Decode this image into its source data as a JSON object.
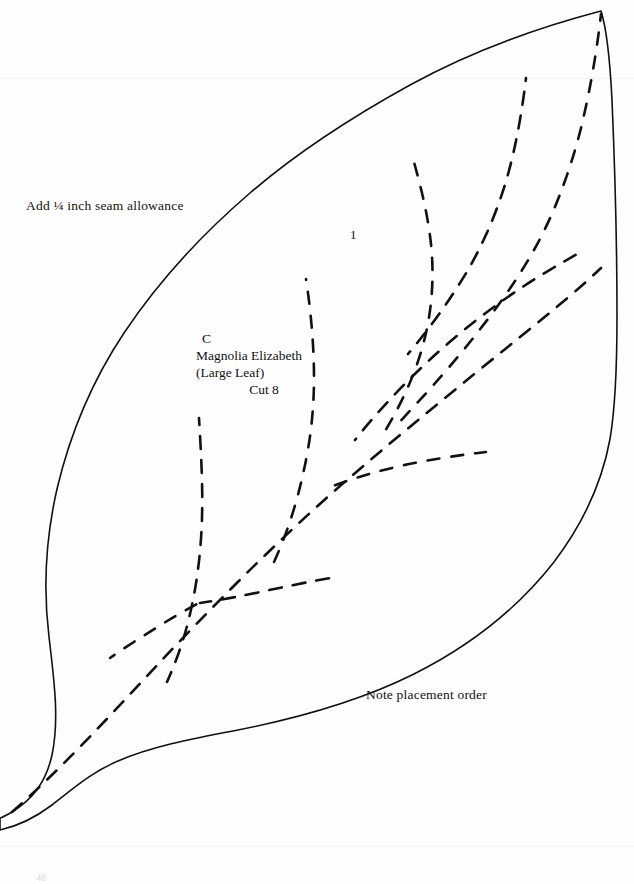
{
  "document": {
    "type": "quilt-pattern-template",
    "background_color": "#fefefe",
    "ink_color": "#111111",
    "page_number": "48"
  },
  "annotations": {
    "seam_allowance_note": "Add ¼ inch seam allowance",
    "placement_note": "Note placement order",
    "order_number": "1"
  },
  "piece_label": {
    "letter": "C",
    "name": "Magnolia Elizabeth",
    "descriptor": "(Large Leaf)",
    "cut_instruction": "Cut 8"
  },
  "shape": {
    "name": "large-leaf-outline",
    "outline_path": "M 601 11 C 540 27 470 52 410 85 C 352 117 300 150 250 193 C 200 236 158 282 124 333 C 92 381 70 434 57 489 C 46 537 43 588 49 637 C 55 686 59 722 52 755 C 46 782 33 799 12 812 C 7 815 3 817 0 818 L 0 830 C 18 826 36 817 52 805 C 74 788 92 772 118 761 C 150 747 190 739 233 731 C 300 718 362 700 414 674 C 470 646 518 608 554 562 C 582 525 602 483 610 439 C 616 404 617 360 617 316 C 617 250 615 170 612 100 C 610 60 607 30 601 11 Z",
    "veins": [
      {
        "name": "midrib",
        "path": "M 12 812 C 60 770 110 716 160 662 C 215 604 275 543 340 486 C 400 434 462 384 520 337 C 556 308 580 288 601 268"
      },
      {
        "name": "vein-upper-right-1",
        "path": "M 601 14 C 597 50 590 92 580 132 C 568 178 552 218 534 250 C 516 282 494 312 470 342 C 446 372 420 400 394 428"
      },
      {
        "name": "vein-upper-right-2",
        "path": "M 526 78 C 522 112 516 146 507 178 C 497 212 484 242 468 270 C 450 300 430 328 408 354"
      },
      {
        "name": "vein-center-long",
        "path": "M 412 155 C 422 190 430 224 432 256 C 434 290 430 322 421 352 C 412 382 398 410 382 436"
      },
      {
        "name": "vein-right-branch-1",
        "path": "M 579 253 C 552 268 524 285 498 304 C 470 324 444 346 420 369 C 396 392 374 416 355 440"
      },
      {
        "name": "vein-right-branch-2",
        "path": "M 486 452 C 460 455 434 459 409 464 C 382 470 356 477 333 486"
      },
      {
        "name": "vein-left-long",
        "path": "M 199 418 C 201 452 203 486 202 518 C 201 552 197 584 190 614 C 184 640 176 662 167 682"
      },
      {
        "name": "vein-left-mid",
        "path": "M 306 279 C 311 312 314 346 314 378 C 314 412 310 444 303 474 C 296 506 286 536 274 562"
      },
      {
        "name": "vein-lower-horizontal",
        "path": "M 337 577 C 312 581 288 586 265 591 C 242 596 220 600 200 603"
      },
      {
        "name": "vein-lower-left-spur",
        "path": "M 199 603 C 184 611 170 619 156 628 C 140 638 124 648 110 658"
      }
    ]
  }
}
